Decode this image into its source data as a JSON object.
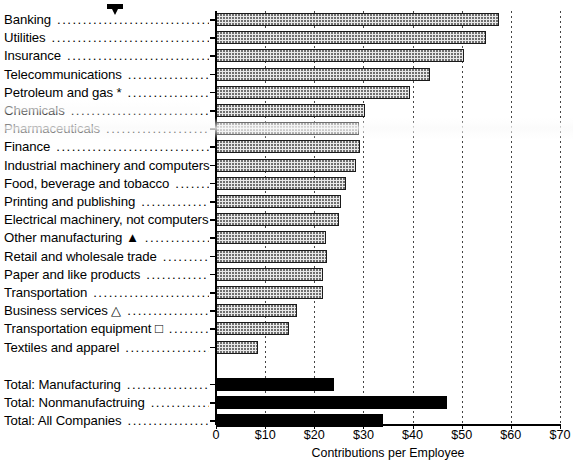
{
  "chart_data": {
    "type": "bar",
    "orientation": "horizontal",
    "title": "",
    "xlabel": "Contributions per Employee",
    "ylabel": "",
    "xlim": [
      0,
      70
    ],
    "xticks": [
      0,
      10,
      20,
      30,
      40,
      50,
      60,
      70
    ],
    "xticklabels": [
      "0",
      "$10",
      "$20",
      "$30",
      "$40",
      "$50",
      "$60",
      "$70"
    ],
    "grid": true,
    "legend": "none",
    "categories": [
      "Banking",
      "Utilities",
      "Insurance",
      "Telecommunications",
      "Petroleum and gas *",
      "Chemicals",
      "Pharmaceuticals",
      "Finance",
      "Industrial machinery and computers",
      "Food, beverage and tobacco",
      "Printing and publishing",
      "Electrical machinery, not computers",
      "Other manufacturing ▲",
      "Retail and wholesale trade",
      "Paper and like products",
      "Transportation",
      "Business services △",
      "Transportation equipment □",
      "Textiles and apparel",
      "Total: Manufacturing",
      "Total: Nonmanufactruing",
      "Total: All Companies"
    ],
    "values": [
      57.5,
      55.0,
      50.5,
      43.5,
      39.5,
      30.3,
      29.0,
      29.3,
      28.5,
      26.5,
      25.5,
      25.0,
      22.3,
      22.5,
      21.8,
      21.8,
      16.5,
      14.8,
      8.5,
      24.0,
      47.0,
      34.0
    ],
    "series_style": [
      "hatched",
      "hatched",
      "hatched",
      "hatched",
      "hatched",
      "hatched",
      "hatched",
      "hatched",
      "hatched",
      "hatched",
      "hatched",
      "hatched",
      "hatched",
      "hatched",
      "hatched",
      "hatched",
      "hatched",
      "hatched",
      "hatched",
      "solid",
      "solid",
      "solid"
    ],
    "footnote_markers": {
      "asterisk": "*",
      "filled_triangle": "▲",
      "open_triangle": "△",
      "open_square": "□"
    },
    "colors": {
      "hatched_fill": "#e9e9e9",
      "hatched_dot": "#6f6f6f",
      "solid_fill": "#000000",
      "axis": "#000000",
      "grid": "#444444"
    }
  },
  "annotations": {
    "pointer_arrow": "down-arrow-marker"
  }
}
